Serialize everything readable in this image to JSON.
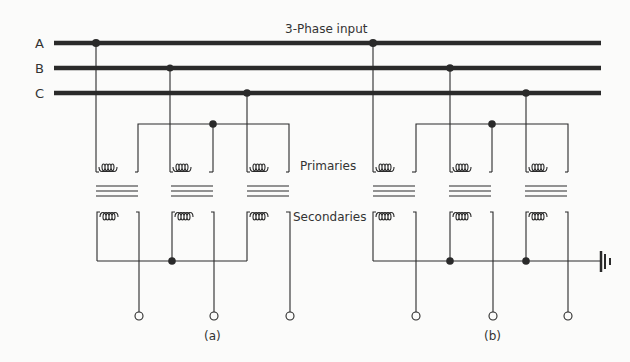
{
  "title": "3-Phase input",
  "bus_labels": {
    "a": "A",
    "b": "B",
    "c": "C"
  },
  "winding_labels": {
    "primaries": "Primaries",
    "secondaries": "Secondaries"
  },
  "subfigure_labels": {
    "a": "(a)",
    "b": "(b)"
  },
  "colors": {
    "ink": "#2a2a2a",
    "background": "#fbfbfa"
  },
  "diagram": {
    "subfigures": [
      {
        "id": "a",
        "primary_connection": "star",
        "secondary_connection": "star",
        "earthed": false
      },
      {
        "id": "b",
        "primary_connection": "star",
        "secondary_connection": "star",
        "earthed": true
      }
    ]
  }
}
